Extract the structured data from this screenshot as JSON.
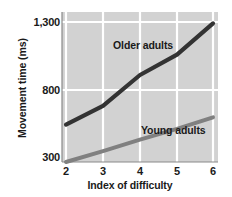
{
  "chart_data": {
    "type": "line",
    "title": "",
    "xlabel": "Index of difficulty",
    "ylabel": "Movement time (ms)",
    "x": [
      2,
      3,
      4,
      5,
      6
    ],
    "xtick_labels": [
      "2",
      "3",
      "4",
      "5",
      "6"
    ],
    "ytick_labels": [
      "1,300",
      "800",
      "300"
    ],
    "ytick_values": [
      1300,
      800,
      300
    ],
    "xlim": [
      2,
      6
    ],
    "ylim": [
      300,
      1300
    ],
    "grid": true,
    "legend_position": "inline-annotations",
    "plot_background": "#d2d2d2",
    "gridline_color": "#ffffff",
    "series": [
      {
        "name": "Older adults",
        "color": "#333333",
        "values": [
          560,
          690,
          910,
          1060,
          1290
        ],
        "label_x": 4.1,
        "label_y": 1170
      },
      {
        "name": "Young adults",
        "color": "#808080",
        "values": [
          300,
          375,
          455,
          530,
          610
        ],
        "label_x": 4.9,
        "label_y": 600
      }
    ]
  },
  "axes": {
    "y_title": "Movement time (ms)",
    "x_title": "Index of difficulty",
    "y_ticks": [
      {
        "label": "1,300",
        "value": 1300
      },
      {
        "label": "800",
        "value": 800
      },
      {
        "label": "300",
        "value": 300
      }
    ],
    "x_ticks": [
      {
        "label": "2",
        "value": 2
      },
      {
        "label": "3",
        "value": 3
      },
      {
        "label": "4",
        "value": 4
      },
      {
        "label": "5",
        "value": 5
      },
      {
        "label": "6",
        "value": 6
      }
    ]
  },
  "annotations": {
    "older_adults": "Older adults",
    "young_adults": "Young adults"
  }
}
